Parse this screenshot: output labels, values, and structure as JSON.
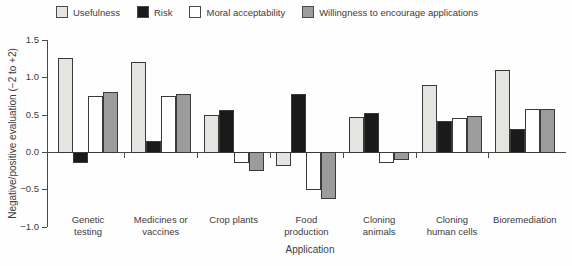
{
  "chart_data": {
    "type": "bar",
    "title": "",
    "xlabel": "Application",
    "ylabel": "Negative/positive evaluation (−2 to +2)",
    "ylim": [
      -1.0,
      1.5
    ],
    "yticks": [
      1.5,
      1.0,
      0.5,
      0.0,
      -0.5,
      -1.0
    ],
    "grid": false,
    "legend_position": "top",
    "categories": [
      "Genetic\ntesting",
      "Medicines or\nvaccines",
      "Crop plants",
      "Food\nproduction",
      "Cloning\nanimals",
      "Cloning\nhuman cells",
      "Bioremediation"
    ],
    "series": [
      {
        "name": "Usefulness",
        "color": "#e4e4e0",
        "values": [
          1.26,
          1.2,
          0.49,
          -0.17,
          0.47,
          0.9,
          1.09
        ]
      },
      {
        "name": "Risk",
        "color": "#1a1a1a",
        "values": [
          -0.13,
          0.15,
          0.56,
          0.77,
          0.52,
          0.41,
          0.31
        ]
      },
      {
        "name": "Moral acceptability",
        "color": "#ffffff",
        "values": [
          0.75,
          0.75,
          -0.13,
          -0.5,
          -0.14,
          0.46,
          0.57
        ]
      },
      {
        "name": "Willingness to encourage applications",
        "color": "#9c9c9c",
        "values": [
          0.8,
          0.77,
          -0.24,
          -0.62,
          -0.1,
          0.48,
          0.57
        ]
      }
    ]
  }
}
